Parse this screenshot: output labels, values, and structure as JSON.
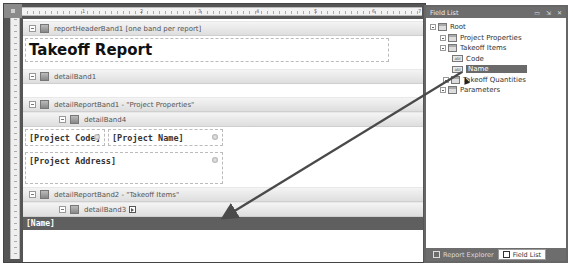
{
  "ruler": {
    "ticks": [
      "1",
      "2",
      "3",
      "4",
      "5",
      "6",
      "7"
    ]
  },
  "designer": {
    "bands": {
      "report_header": "reportHeaderBand1 [one band per report]",
      "detail_band1": "detailBand1",
      "detail_report_band1": "detailReportBand1 - \"Project Properties\"",
      "detail_band4": "detailBand4",
      "detail_report_band2": "detailReportBand2 - \"Takeoff Items\"",
      "detail_band3": "detailBand3"
    },
    "fields": {
      "title": "Takeoff Report",
      "project_code": "[Project Code]",
      "project_name": "[Project Name]",
      "project_address": "[Project Address]",
      "name": "[Name]"
    }
  },
  "field_list": {
    "title": "Field List",
    "title_buttons": [
      "▭",
      "⇲",
      "✕"
    ],
    "tree": {
      "root": "Root",
      "project_properties": "Project Properties",
      "takeoff_items": "Takeoff Items",
      "code": "Code",
      "name": "Name",
      "takeoff_quantities": "Takeoff Quantities",
      "parameters": "Parameters"
    },
    "field_icon_text": "abl",
    "tabs": {
      "report_explorer": "Report Explorer",
      "field_list": "Field List"
    }
  },
  "colors": {
    "dark_bar": "#5f5f5f",
    "selection": "#6a6a6a",
    "arrow": "#4a4a4a"
  }
}
